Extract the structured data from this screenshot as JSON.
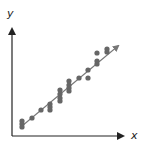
{
  "chart_data": {
    "type": "scatter",
    "title": "",
    "xlabel": "x",
    "ylabel": "y",
    "grid": false,
    "legend": null,
    "ticks": {
      "x": [],
      "y": []
    },
    "trend_line": {
      "from": [
        22,
        126
      ],
      "to": [
        118,
        46
      ],
      "arrow": true
    },
    "points": [
      [
        22,
        121
      ],
      [
        22,
        124
      ],
      [
        22,
        127
      ],
      [
        32,
        118
      ],
      [
        41,
        110
      ],
      [
        50,
        104
      ],
      [
        50,
        107
      ],
      [
        50,
        110
      ],
      [
        60,
        90
      ],
      [
        60,
        94
      ],
      [
        60,
        98
      ],
      [
        60,
        101
      ],
      [
        69,
        81
      ],
      [
        69,
        85
      ],
      [
        69,
        88
      ],
      [
        69,
        91
      ],
      [
        79,
        78
      ],
      [
        88,
        70
      ],
      [
        88,
        78
      ],
      [
        97,
        53
      ],
      [
        97,
        61
      ],
      [
        97,
        64
      ],
      [
        107,
        49
      ],
      [
        107,
        52
      ]
    ],
    "colors": {
      "axis": "#222222",
      "points": "#666666",
      "line": "#777777"
    }
  },
  "labels": {
    "x_axis": "x",
    "y_axis": "y"
  }
}
